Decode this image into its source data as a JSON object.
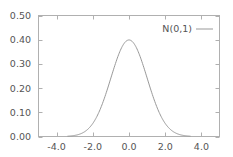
{
  "chart_data": {
    "type": "line",
    "title": "",
    "xlabel": "",
    "ylabel": "",
    "xlim": [
      -5.0,
      5.0
    ],
    "ylim": [
      0.0,
      0.5
    ],
    "grid": false,
    "legend_position": "top-right",
    "x_ticks": [
      -4.0,
      -2.0,
      0.0,
      2.0,
      4.0
    ],
    "x_tick_labels": [
      "-4.0",
      "-2.0",
      "0.0",
      "2.0",
      "4.0"
    ],
    "y_ticks": [
      0.0,
      0.1,
      0.2,
      0.3,
      0.4,
      0.5
    ],
    "y_tick_labels": [
      "0.00",
      "0.10",
      "0.20",
      "0.30",
      "0.40",
      "0.50"
    ],
    "series": [
      {
        "name": "N(0,1)",
        "color": "#999999",
        "function": "standard normal pdf",
        "x_range": [
          -3.4,
          3.4
        ],
        "x": [
          -3.4,
          -3.0,
          -2.5,
          -2.0,
          -1.5,
          -1.0,
          -0.5,
          0.0,
          0.5,
          1.0,
          1.5,
          2.0,
          2.5,
          3.0,
          3.4
        ],
        "values": [
          0.0012,
          0.0044,
          0.0175,
          0.054,
          0.1295,
          0.242,
          0.3521,
          0.3989,
          0.3521,
          0.242,
          0.1295,
          0.054,
          0.0175,
          0.0044,
          0.0012
        ]
      }
    ]
  },
  "legend": {
    "label": "N(0,1)"
  },
  "colors": {
    "axis": "#b0b0b0",
    "curve": "#999999",
    "text": "#555555",
    "background": "#ffffff"
  }
}
